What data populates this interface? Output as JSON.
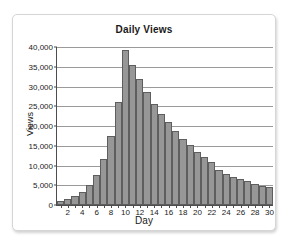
{
  "card": {
    "accent_color": "#979797",
    "border_color": "#d6d6d6"
  },
  "chart_data": {
    "type": "bar",
    "title": "Daily Views",
    "xlabel": "Day",
    "ylabel": "Views",
    "grid": true,
    "legend": "none",
    "xlim": [
      0,
      31
    ],
    "ylim": [
      0,
      40000
    ],
    "ytick_labels": [
      "40,000",
      "35,000",
      "30,000",
      "25,000",
      "20,000",
      "15,000",
      "10,000",
      "5,000",
      "0"
    ],
    "ytick_values": [
      40000,
      35000,
      30000,
      25000,
      20000,
      15000,
      10000,
      5000,
      0
    ],
    "xtick_labels": [
      "2",
      "4",
      "6",
      "8",
      "10",
      "12",
      "14",
      "16",
      "18",
      "20",
      "22",
      "24",
      "26",
      "28",
      "30"
    ],
    "xtick_values": [
      2,
      4,
      6,
      8,
      10,
      12,
      14,
      16,
      18,
      20,
      22,
      24,
      26,
      28,
      30
    ],
    "categories": [
      1,
      2,
      3,
      4,
      5,
      6,
      7,
      8,
      9,
      10,
      11,
      12,
      13,
      14,
      15,
      16,
      17,
      18,
      19,
      20,
      21,
      22,
      23,
      24,
      25,
      26,
      27,
      28,
      29,
      30
    ],
    "values": [
      900,
      1500,
      2200,
      3400,
      5000,
      7600,
      11700,
      17400,
      26000,
      39300,
      35400,
      31800,
      28600,
      25700,
      23100,
      20900,
      18700,
      16800,
      15200,
      13500,
      12100,
      11000,
      8900,
      7800,
      7000,
      6600,
      6000,
      5400,
      4900,
      4600
    ],
    "bar_color": "#979797",
    "bar_border_color": "#5e5e5e"
  }
}
